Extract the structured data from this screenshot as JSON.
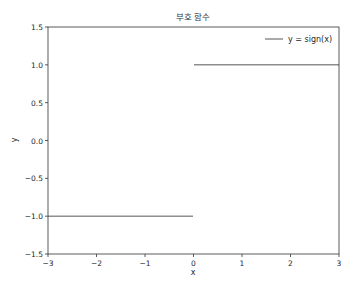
{
  "chart_data": {
    "type": "line",
    "title": "부호 함수",
    "xlabel": "x",
    "ylabel": "y",
    "xlim": [
      -3,
      3
    ],
    "ylim": [
      -1.5,
      1.5
    ],
    "xticks": [
      -3,
      -2,
      -1,
      0,
      1,
      2,
      3
    ],
    "xtick_labels": [
      "−3",
      "−2",
      "−1",
      "0",
      "1",
      "2",
      "3"
    ],
    "yticks": [
      -1.5,
      -1.0,
      -0.5,
      0.0,
      0.5,
      1.0,
      1.5
    ],
    "ytick_labels": [
      "−1.5",
      "−1.0",
      "−0.5",
      "0.0",
      "0.5",
      "1.0",
      "1.5"
    ],
    "grid": false,
    "legend": {
      "position": "top-right",
      "entries": [
        "y = sign(x)"
      ]
    },
    "series": [
      {
        "name": "y = sign(x)",
        "color": "#555555",
        "segments": [
          {
            "x": [
              -3,
              -0.01
            ],
            "y": [
              -1,
              -1
            ]
          },
          {
            "x": [
              0.01,
              3
            ],
            "y": [
              1,
              1
            ]
          }
        ]
      }
    ]
  }
}
